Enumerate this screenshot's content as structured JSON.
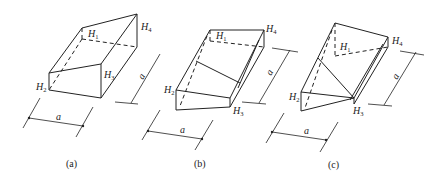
{
  "figure": {
    "panels": [
      {
        "id": "a",
        "caption": "(a)",
        "labels": {
          "h1": "H",
          "h1_sub": "1",
          "h2": "H",
          "h2_sub": "2",
          "h3": "H",
          "h3_sub": "3",
          "h4": "H",
          "h4_sub": "4"
        },
        "dim_width": "a",
        "dim_depth": "a"
      },
      {
        "id": "b",
        "caption": "(b)",
        "labels": {
          "h1": "H",
          "h1_sub": "1",
          "h2": "H",
          "h2_sub": "2",
          "h3": "H",
          "h3_sub": "3",
          "h4": "H",
          "h4_sub": "4"
        },
        "dim_width": "a",
        "dim_depth": "a"
      },
      {
        "id": "c",
        "caption": "(c)",
        "labels": {
          "h1": "H",
          "h1_sub": "1",
          "h2": "H",
          "h2_sub": "2",
          "h3": "H",
          "h3_sub": "3",
          "h4": "H",
          "h4_sub": "4"
        },
        "dim_width": "a",
        "dim_depth": "a"
      }
    ]
  }
}
